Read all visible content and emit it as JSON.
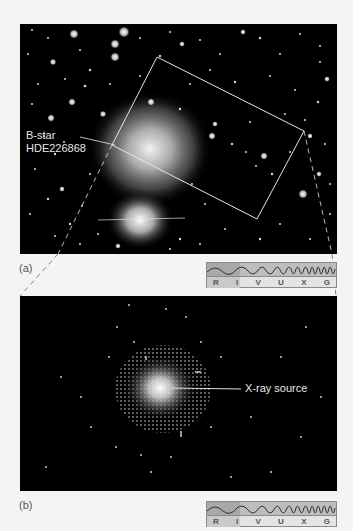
{
  "figure": {
    "panel_a": {
      "letter": "(a)",
      "annotation_line1": "B-star",
      "annotation_line2": "HDE226868"
    },
    "panel_b": {
      "letter": "(b)",
      "annotation": "X-ray source"
    },
    "spectrum_bar": {
      "bands": [
        "R",
        "I",
        "V",
        "U",
        "X",
        "G"
      ],
      "highlighted_band_a": "R",
      "highlighted_band_b": "R"
    },
    "colors": {
      "background": "#f4f4f2",
      "sky": "#000000",
      "overlay_lines": "#e6e6e6",
      "spectrum_wave": "#bdbdbd",
      "spectrum_highlight": "#a8a8a8"
    }
  }
}
